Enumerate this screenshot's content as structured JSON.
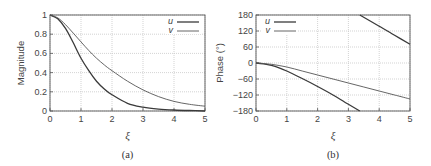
{
  "chart_data": [
    {
      "type": "line",
      "panel_label": "(a)",
      "title": "",
      "xlabel": "ξ",
      "ylabel": "Magnitude",
      "xlim": [
        0,
        5
      ],
      "ylim": [
        0,
        1
      ],
      "xticks": [
        "0",
        "1",
        "2",
        "3",
        "4",
        "5"
      ],
      "yticks": [
        "0",
        "0.2",
        "0.4",
        "0.6",
        "0.8",
        "1"
      ],
      "grid": true,
      "legend_position": "upper right",
      "x": [
        0,
        0.25,
        0.5,
        0.75,
        1,
        1.25,
        1.5,
        1.75,
        2,
        2.5,
        3,
        3.5,
        4,
        4.5,
        5
      ],
      "series": [
        {
          "name": "u",
          "style": "solid",
          "values": [
            1.0,
            0.96,
            0.86,
            0.71,
            0.55,
            0.42,
            0.31,
            0.23,
            0.17,
            0.08,
            0.04,
            0.02,
            0.01,
            0.005,
            0.0
          ]
        },
        {
          "name": "v",
          "style": "dotted",
          "values": [
            1.0,
            0.97,
            0.9,
            0.81,
            0.72,
            0.63,
            0.55,
            0.48,
            0.42,
            0.31,
            0.22,
            0.15,
            0.1,
            0.07,
            0.05
          ]
        }
      ]
    },
    {
      "type": "line",
      "panel_label": "(b)",
      "title": "",
      "xlabel": "ξ",
      "ylabel": "Phase (°)",
      "xlim": [
        0,
        5
      ],
      "ylim": [
        -180,
        180
      ],
      "xticks": [
        "0",
        "1",
        "2",
        "3",
        "4",
        "5"
      ],
      "yticks": [
        "-180",
        "-120",
        "-60",
        "0",
        "60",
        "120",
        "180"
      ],
      "grid": true,
      "legend_position": "upper left",
      "series": [
        {
          "name": "u",
          "style": "solid",
          "x": [
            0,
            0.25,
            0.5,
            0.75,
            1,
            1.5,
            2,
            2.5,
            3,
            3.37,
            3.37,
            4,
            4.5,
            5
          ],
          "values": [
            0,
            -3,
            -9,
            -18,
            -30,
            -58,
            -88,
            -120,
            -155,
            -180,
            180,
            138,
            104,
            70
          ]
        },
        {
          "name": "v",
          "style": "dotted",
          "x": [
            0,
            0.5,
            1,
            1.5,
            2,
            2.5,
            3,
            3.5,
            4,
            4.5,
            5
          ],
          "values": [
            0,
            -5,
            -15,
            -30,
            -45,
            -60,
            -75,
            -90,
            -105,
            -120,
            -135
          ]
        }
      ]
    }
  ],
  "panels": {
    "a": {
      "ylabel": "Magnitude",
      "xlabel": "ξ",
      "caption": "(a)",
      "legend": [
        "u",
        "v"
      ]
    },
    "b": {
      "ylabel": "Phase (°)",
      "xlabel": "ξ",
      "caption": "(b)",
      "legend": [
        "u",
        "v"
      ]
    }
  },
  "colors": {
    "axis": "#555555",
    "grid": "#c8c8c8",
    "u": "#3a3a3a",
    "v": "#555555"
  }
}
